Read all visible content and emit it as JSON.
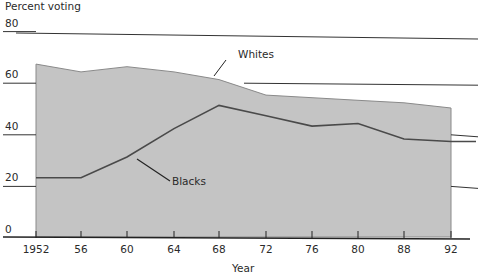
{
  "chart_data": {
    "type": "area",
    "title": "",
    "ylabel": "Percent voting",
    "xlabel": "Year",
    "x": [
      "1952",
      "56",
      "60",
      "64",
      "68",
      "72",
      "76",
      "80",
      "88",
      "92"
    ],
    "yticks": [
      "0",
      "20",
      "40",
      "60",
      "80"
    ],
    "ylim": [
      0,
      80
    ],
    "grid": false,
    "series": [
      {
        "name": "Whites",
        "style": "filled area",
        "values": [
          67,
          64,
          66,
          64,
          61,
          55,
          54,
          53,
          52,
          50
        ]
      },
      {
        "name": "Blacks",
        "style": "line",
        "values": [
          23,
          23,
          31,
          42,
          51,
          47,
          43,
          44,
          38,
          37
        ]
      }
    ],
    "annotations": [
      {
        "text": "Whites",
        "points_to_year": "68"
      },
      {
        "text": "Blacks",
        "points_to_year": "60"
      }
    ],
    "colors": {
      "fill": "#c4c4c4",
      "line": "#4a4a4a",
      "axis": "#222222"
    }
  }
}
